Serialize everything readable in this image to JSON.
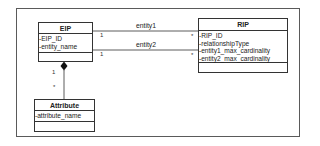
{
  "diagram": {
    "type": "uml-class-diagram",
    "classes": [
      {
        "name": "EIP",
        "attributes": [
          "-EIP_ID",
          "-entity_name"
        ],
        "operations": []
      },
      {
        "name": "RIP",
        "attributes": [
          "-RIP_ID",
          "-relationshipType",
          "-entity1_max_cardinality",
          "-entity2_max_cardinality"
        ],
        "operations": []
      },
      {
        "name": "Attribute",
        "attributes": [
          "-attribute_name"
        ],
        "operations": []
      }
    ],
    "associations": [
      {
        "from": "EIP",
        "to": "RIP",
        "label": "entity1",
        "from_multiplicity": "1",
        "to_multiplicity": "*"
      },
      {
        "from": "EIP",
        "to": "RIP",
        "label": "entity2",
        "from_multiplicity": "1",
        "to_multiplicity": "*"
      },
      {
        "from": "EIP",
        "to": "Attribute",
        "kind": "composition",
        "from_multiplicity": "1",
        "to_multiplicity": "*"
      }
    ]
  }
}
